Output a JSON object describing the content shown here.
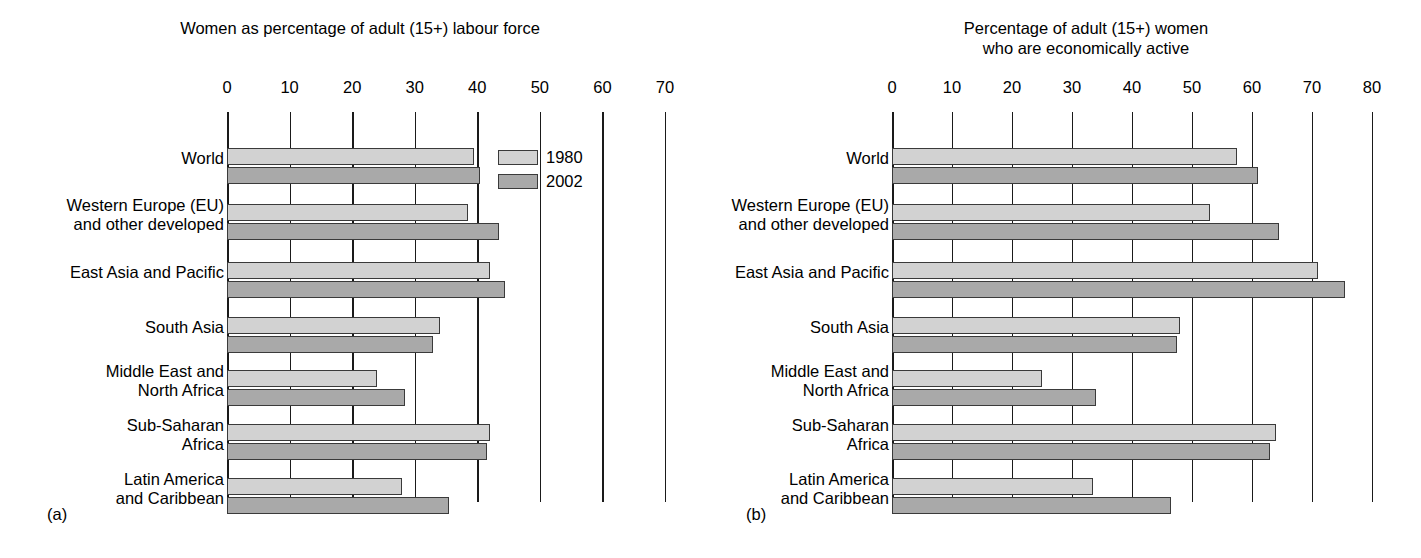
{
  "figure": {
    "panels": [
      {
        "tag": "(a)",
        "title": "Women as percentage of adult (15+) labour force",
        "axis": {
          "ticks": [
            0,
            10,
            20,
            30,
            40,
            50,
            60,
            70
          ],
          "min": 0,
          "max": 70
        }
      },
      {
        "tag": "(b)",
        "title": "Percentage of adult (15+) women\nwho are economically active",
        "axis": {
          "ticks": [
            0,
            10,
            20,
            30,
            40,
            50,
            60,
            70,
            80
          ],
          "min": 0,
          "max": 80
        }
      }
    ]
  },
  "legend": {
    "position": "inside-top-right-panel-a",
    "entries": [
      {
        "label": "1980",
        "color": "#d2d2d2"
      },
      {
        "label": "2002",
        "color": "#a9a9a9"
      }
    ]
  },
  "categories": [
    "World",
    "Western Europe (EU)\nand other developed",
    "East Asia and Pacific",
    "South Asia",
    "Middle East and\nNorth Africa",
    "Sub-Saharan\nAfrica",
    "Latin America\nand Caribbean"
  ],
  "chart_data": [
    {
      "type": "bar",
      "orientation": "horizontal",
      "title": "Women as percentage of adult (15+) labour force",
      "xlabel": "",
      "ylabel": "",
      "xlim": [
        0,
        70
      ],
      "grid": true,
      "legend_position": "top-right",
      "categories": [
        "World",
        "Western Europe (EU) and other developed",
        "East Asia and Pacific",
        "South Asia",
        "Middle East and North Africa",
        "Sub-Saharan Africa",
        "Latin America and Caribbean"
      ],
      "series": [
        {
          "name": "1980",
          "color": "#d2d2d2",
          "values": [
            39.5,
            38.5,
            42.0,
            34.0,
            24.0,
            42.0,
            28.0
          ]
        },
        {
          "name": "2002",
          "color": "#a9a9a9",
          "values": [
            40.5,
            43.5,
            44.5,
            33.0,
            28.5,
            41.5,
            35.5
          ]
        }
      ]
    },
    {
      "type": "bar",
      "orientation": "horizontal",
      "title": "Percentage of adult (15+) women who are economically active",
      "xlabel": "",
      "ylabel": "",
      "xlim": [
        0,
        80
      ],
      "grid": true,
      "legend_position": "none",
      "categories": [
        "World",
        "Western Europe (EU) and other developed",
        "East Asia and Pacific",
        "South Asia",
        "Middle East and North Africa",
        "Sub-Saharan Africa",
        "Latin America and Caribbean"
      ],
      "series": [
        {
          "name": "1980",
          "color": "#d2d2d2",
          "values": [
            57.5,
            53.0,
            71.0,
            48.0,
            25.0,
            64.0,
            33.5
          ]
        },
        {
          "name": "2002",
          "color": "#a9a9a9",
          "values": [
            61.0,
            64.5,
            75.5,
            47.5,
            34.0,
            63.0,
            46.5
          ]
        }
      ]
    }
  ]
}
